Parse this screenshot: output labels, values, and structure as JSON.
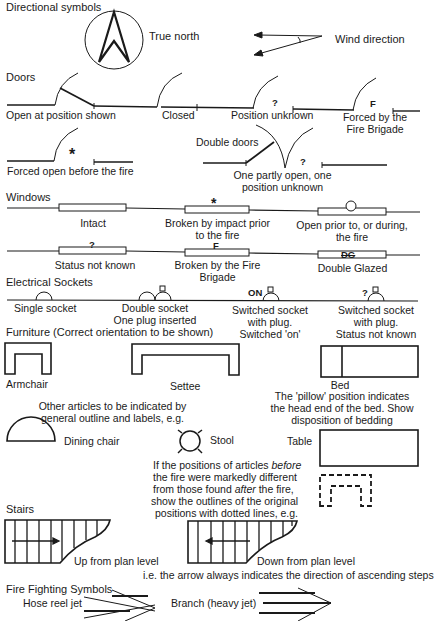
{
  "sections": {
    "directional": {
      "heading": "Directional symbols",
      "true_north": "True north",
      "wind_direction": "Wind direction"
    },
    "doors": {
      "heading": "Doors",
      "open_at_position": "Open at position shown",
      "closed": "Closed",
      "position_unknown_mark": "?",
      "position_unknown": "Position unknown",
      "forced_mark": "F",
      "forced_line1": "Forced by the",
      "forced_line2": "Fire Brigade",
      "forced_open_mark": "*",
      "forced_open": "Forced open before the fire",
      "double_doors": "Double doors",
      "double_mark": "?",
      "double_line1": "One partly open, one",
      "double_line2": "position unknown"
    },
    "windows": {
      "heading": "Windows",
      "intact": "Intact",
      "broken_impact_mark": "*",
      "broken_impact_line1": "Broken by impact prior",
      "broken_impact_line2": "to the fire",
      "open_line1": "Open prior to, or during,",
      "open_line2": "the fire",
      "unknown_mark": "?",
      "unknown": "Status not known",
      "brigade_mark": "F",
      "brigade_line1": "Broken by the Fire",
      "brigade_line2": "Brigade",
      "double_mark": "DG",
      "double_glazed": "Double Glazed"
    },
    "sockets": {
      "heading": "Electrical Sockets",
      "single": "Single socket",
      "double_line1": "Double socket",
      "double_line2": "One plug inserted",
      "on_mark": "ON",
      "switched_on_line1": "Switched socket",
      "switched_on_line2": "with plug.",
      "switched_on_line3": "Switched 'on'",
      "unknown_mark": "?",
      "switched_unknown_line1": "Switched socket",
      "switched_unknown_line2": "with plug.",
      "switched_unknown_line3": "Status not known"
    },
    "furniture": {
      "heading": "Furniture (Correct orientation to be shown)",
      "armchair": "Armchair",
      "settee": "Settee",
      "bed": "Bed",
      "bed_note_line1": "The 'pillow' position indicates",
      "bed_note_line2": "the head end of the bed. Show",
      "bed_note_line3": "disposition of bedding",
      "other_line1": "Other articles to be indicated by",
      "other_line2": "general outline and labels, e.g.",
      "dining_chair": "Dining chair",
      "stool": "Stool",
      "table": "Table",
      "moved_line1_a": "If the positions of articles ",
      "moved_line1_b": "before",
      "moved_line2": "the fire were markedly different",
      "moved_line3_a": "from those found ",
      "moved_line3_b": "after",
      "moved_line3_c": " the fire,",
      "moved_line4": "show the outlines of the original",
      "moved_line5": "positions with dotted lines, e.g."
    },
    "stairs": {
      "heading": "Stairs",
      "up": "Up from plan level",
      "down": "Down from plan level",
      "note": "i.e. the arrow always indicates the direction of ascending steps"
    },
    "fire_fighting": {
      "heading": "Fire Fighting Symbols",
      "hose_reel": "Hose reel jet",
      "branch": "Branch (heavy jet)"
    }
  },
  "icons": [
    "north-arrow-icon",
    "wind-arrow-icon",
    "door-icon",
    "window-icon",
    "socket-icon",
    "armchair-icon",
    "settee-icon",
    "bed-icon",
    "dining-chair-icon",
    "stool-icon",
    "table-icon",
    "dotted-outline-icon",
    "stairs-up-icon",
    "stairs-down-icon",
    "hose-reel-jet-icon",
    "branch-jet-icon"
  ],
  "colors": {
    "ink": "#1a1a1a",
    "background": "#ffffff"
  }
}
